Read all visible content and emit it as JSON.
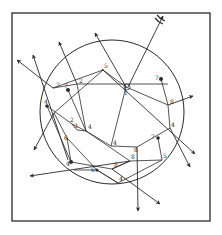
{
  "figure": {
    "colors": {
      "ink": "#2a2a2a",
      "paper": "#ffffff"
    },
    "frame": {
      "x": 12,
      "y": 13,
      "width": 198,
      "height": 208
    },
    "circle": {
      "cx": 112,
      "cy": 112,
      "r": 72
    },
    "nodes": [
      {
        "id": "a",
        "x": 53,
        "y": 88,
        "label": "7"
      },
      {
        "id": "b",
        "x": 68,
        "y": 90,
        "label": "7"
      },
      {
        "id": "c",
        "x": 77,
        "y": 84,
        "label": "2"
      },
      {
        "id": "d",
        "x": 103,
        "y": 70,
        "label": "5"
      },
      {
        "id": "e",
        "x": 126,
        "y": 87,
        "label": "1"
      },
      {
        "id": "f",
        "x": 161,
        "y": 79,
        "label": "7"
      },
      {
        "id": "g",
        "x": 168,
        "y": 105,
        "label": "8"
      },
      {
        "id": "h",
        "x": 47,
        "y": 106,
        "label": "4"
      },
      {
        "id": "i",
        "x": 54,
        "y": 113,
        "label": ""
      },
      {
        "id": "j",
        "x": 72,
        "y": 124,
        "label": "2"
      },
      {
        "id": "k",
        "x": 77,
        "y": 130,
        "label": "3"
      },
      {
        "id": "l",
        "x": 86,
        "y": 131,
        "label": "4"
      },
      {
        "id": "m",
        "x": 67,
        "y": 138,
        "label": "6"
      },
      {
        "id": "n",
        "x": 111,
        "y": 146,
        "label": "4"
      },
      {
        "id": "o",
        "x": 137,
        "y": 147,
        "label": "8"
      },
      {
        "id": "p",
        "x": 170,
        "y": 128,
        "label": "4"
      },
      {
        "id": "q",
        "x": 158,
        "y": 138,
        "label": "7"
      },
      {
        "id": "r",
        "x": 71,
        "y": 162,
        "label": "4"
      },
      {
        "id": "s",
        "x": 74,
        "y": 170,
        "label": "8"
      },
      {
        "id": "t",
        "x": 97,
        "y": 170,
        "label": "6"
      },
      {
        "id": "u",
        "x": 112,
        "y": 169,
        "label": "8"
      },
      {
        "id": "v",
        "x": 130,
        "y": 161,
        "label": "8"
      },
      {
        "id": "w",
        "x": 162,
        "y": 160,
        "label": "5"
      },
      {
        "id": "x",
        "x": 118,
        "y": 183,
        "label": "4"
      }
    ],
    "arrows_out": [
      {
        "from": [
          53,
          88
        ],
        "to": [
          17,
          60
        ]
      },
      {
        "from": [
          68,
          160
        ],
        "to": [
          33,
          55
        ]
      },
      {
        "from": [
          77,
          84
        ],
        "to": [
          59,
          42
        ]
      },
      {
        "from": [
          126,
          87
        ],
        "to": [
          95,
          33
        ]
      },
      {
        "from": [
          128,
          87
        ],
        "to": [
          163,
          15
        ]
      },
      {
        "from": [
          130,
          161
        ],
        "to": [
          30,
          176
        ]
      },
      {
        "from": [
          54,
          113
        ],
        "to": [
          34,
          150
        ]
      },
      {
        "from": [
          168,
          105
        ],
        "to": [
          193,
          95
        ]
      },
      {
        "from": [
          137,
          147
        ],
        "to": [
          138,
          212
        ]
      },
      {
        "from": [
          170,
          128
        ],
        "to": [
          190,
          168
        ]
      },
      {
        "from": [
          112,
          169
        ],
        "to": [
          161,
          205
        ]
      },
      {
        "from": [
          103,
          70
        ],
        "to": [
          195,
          155
        ]
      }
    ],
    "caption": ""
  }
}
